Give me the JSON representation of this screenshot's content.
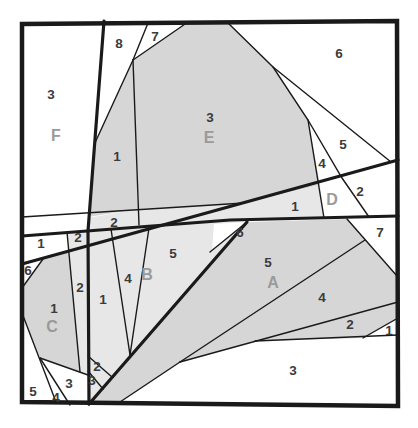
{
  "figure": {
    "canvas": {
      "width": 418,
      "height": 428
    },
    "colors": {
      "background": "#ffffff",
      "line": "#1a1a1a",
      "shade_medium": "#d6d6d6",
      "shade_light": "#e7e7e7",
      "number_label": "#3b3b3b",
      "letter_label": "#9a9a9a"
    },
    "border": {
      "points": [
        [
          22,
          24
        ],
        [
          397,
          21
        ],
        [
          398,
          406
        ],
        [
          22,
          402
        ]
      ],
      "stroke_width": 4.5
    },
    "polygons": [
      {
        "name": "region-E-fill",
        "fill": "medium",
        "points": [
          [
            133,
            60
          ],
          [
            188,
            22
          ],
          [
            227,
            22
          ],
          [
            273,
            67
          ],
          [
            308,
            120
          ],
          [
            320,
            185
          ],
          [
            244,
            203
          ],
          [
            139,
            209
          ]
        ]
      },
      {
        "name": "strip-1-upper-fill",
        "fill": "medium",
        "points": [
          [
            133,
            60
          ],
          [
            94,
            145
          ],
          [
            88,
            217
          ],
          [
            138,
            209
          ]
        ]
      },
      {
        "name": "strip-2-under-E-fill",
        "fill": "light",
        "points": [
          [
            88,
            218
          ],
          [
            138,
            209
          ],
          [
            139,
            225
          ],
          [
            88,
            230
          ]
        ]
      },
      {
        "name": "band-1-D-fill",
        "fill": "light",
        "points": [
          [
            139,
            209
          ],
          [
            244,
            203
          ],
          [
            320,
            185
          ],
          [
            324,
            218
          ],
          [
            230,
            220
          ],
          [
            145,
            230
          ],
          [
            139,
            225
          ]
        ]
      },
      {
        "name": "region-B-fill",
        "fill": "light",
        "points": [
          [
            88,
            230
          ],
          [
            230,
            220
          ],
          [
            247,
            222
          ],
          [
            89,
            404
          ]
        ]
      },
      {
        "name": "wedge-6-fill",
        "fill": "white",
        "points": [
          [
            247,
            222
          ],
          [
            212,
            251
          ],
          [
            214,
            224
          ]
        ]
      },
      {
        "name": "region-A-fill",
        "fill": "medium",
        "points": [
          [
            89,
            404
          ],
          [
            247,
            222
          ],
          [
            347,
            219
          ],
          [
            397,
            276
          ],
          [
            398,
            318
          ],
          [
            363,
            338
          ],
          [
            255,
            341
          ],
          [
            180,
            362
          ],
          [
            120,
            402
          ]
        ]
      },
      {
        "name": "region-C-fill",
        "fill": "medium",
        "points": [
          [
            22,
            288
          ],
          [
            43,
            259
          ],
          [
            69,
            251
          ],
          [
            80,
            372
          ],
          [
            40,
            358
          ],
          [
            22,
            313
          ]
        ]
      },
      {
        "name": "strip-2-left-up-fill",
        "fill": "light",
        "points": [
          [
            67,
            232
          ],
          [
            88,
            231
          ],
          [
            88,
            246
          ],
          [
            69,
            251
          ]
        ]
      },
      {
        "name": "strip-2-left-lo-fill",
        "fill": "light",
        "points": [
          [
            69,
            251
          ],
          [
            88,
            246
          ],
          [
            88,
            375
          ],
          [
            80,
            372
          ]
        ]
      }
    ],
    "thick_lines": [
      {
        "name": "vertical-main-line",
        "points": [
          [
            104,
            21
          ],
          [
            88,
            231
          ],
          [
            89,
            404
          ]
        ]
      },
      {
        "name": "diagonal-upper-line",
        "points": [
          [
            22,
            264
          ],
          [
            398,
            160
          ]
        ]
      },
      {
        "name": "diagonal-middle-line",
        "points": [
          [
            22,
            236
          ],
          [
            230,
            220
          ],
          [
            398,
            216
          ]
        ]
      },
      {
        "name": "diagonal-B-line",
        "points": [
          [
            89,
            404
          ],
          [
            247,
            222
          ]
        ]
      }
    ],
    "thin_lines": [
      {
        "name": "E-bottom-line",
        "points": [
          [
            22,
            217
          ],
          [
            244,
            203
          ]
        ]
      },
      {
        "name": "seven-left-edge",
        "points": [
          [
            148,
            23
          ],
          [
            133,
            60
          ]
        ]
      },
      {
        "name": "seven-right-edge",
        "points": [
          [
            188,
            22
          ],
          [
            133,
            60
          ]
        ]
      },
      {
        "name": "eight-bottom-line",
        "points": [
          [
            133,
            60
          ],
          [
            94,
            145
          ]
        ]
      },
      {
        "name": "E-left-edge",
        "points": [
          [
            133,
            60
          ],
          [
            139,
            225
          ]
        ]
      },
      {
        "name": "E-right-edge",
        "points": [
          [
            227,
            22
          ],
          [
            273,
            67
          ],
          [
            308,
            120
          ],
          [
            324,
            218
          ]
        ]
      },
      {
        "name": "six-five-line",
        "points": [
          [
            273,
            67
          ],
          [
            391,
            162
          ]
        ]
      },
      {
        "name": "four-five-D-line",
        "points": [
          [
            308,
            120
          ],
          [
            342,
            178
          ],
          [
            369,
            217
          ]
        ]
      },
      {
        "name": "six-hypotenuse",
        "points": [
          [
            22,
            288
          ],
          [
            43,
            259
          ]
        ]
      },
      {
        "name": "left-strip-line",
        "points": [
          [
            67,
            232
          ],
          [
            80,
            372
          ]
        ]
      },
      {
        "name": "C-left-edge",
        "points": [
          [
            22,
            313
          ],
          [
            56,
            402
          ]
        ]
      },
      {
        "name": "C-bottom-edge",
        "points": [
          [
            40,
            358
          ],
          [
            88,
            375
          ]
        ]
      },
      {
        "name": "four-three-line",
        "points": [
          [
            40,
            358
          ],
          [
            70,
            405
          ]
        ]
      },
      {
        "name": "B-strip-line-a",
        "points": [
          [
            111,
            229
          ],
          [
            130,
            355
          ]
        ]
      },
      {
        "name": "B-strip-line-b",
        "points": [
          [
            149,
            228
          ],
          [
            130,
            355
          ]
        ]
      },
      {
        "name": "six-wedge-line",
        "points": [
          [
            210,
            252
          ],
          [
            247,
            222
          ]
        ]
      },
      {
        "name": "mini-two-line",
        "points": [
          [
            88,
            356
          ],
          [
            112,
            377
          ]
        ]
      },
      {
        "name": "mini-three-line",
        "points": [
          [
            88,
            371
          ],
          [
            103,
            389
          ]
        ]
      },
      {
        "name": "five-four-A-line",
        "points": [
          [
            180,
            362
          ],
          [
            365,
            240
          ]
        ]
      },
      {
        "name": "four-two-A-line",
        "points": [
          [
            180,
            362
          ],
          [
            398,
            302
          ]
        ]
      },
      {
        "name": "A-bottom-line",
        "points": [
          [
            120,
            402
          ],
          [
            180,
            362
          ]
        ]
      },
      {
        "name": "three-top-line",
        "points": [
          [
            255,
            341
          ],
          [
            398,
            335
          ]
        ]
      },
      {
        "name": "two-one-line",
        "points": [
          [
            363,
            338
          ],
          [
            398,
            318
          ]
        ]
      },
      {
        "name": "seven-wedge-edge",
        "points": [
          [
            347,
            219
          ],
          [
            397,
            276
          ]
        ]
      }
    ],
    "labels": [
      {
        "text": "8",
        "x": 119,
        "y": 43,
        "kind": "number"
      },
      {
        "text": "7",
        "x": 155,
        "y": 36,
        "kind": "number"
      },
      {
        "text": "6",
        "x": 339,
        "y": 53,
        "kind": "number"
      },
      {
        "text": "3",
        "x": 51,
        "y": 94,
        "kind": "number"
      },
      {
        "text": "F",
        "x": 56,
        "y": 135,
        "kind": "letter"
      },
      {
        "text": "3",
        "x": 210,
        "y": 117,
        "kind": "number"
      },
      {
        "text": "E",
        "x": 209,
        "y": 137,
        "kind": "letter"
      },
      {
        "text": "1",
        "x": 117,
        "y": 156,
        "kind": "number"
      },
      {
        "text": "5",
        "x": 343,
        "y": 144,
        "kind": "number"
      },
      {
        "text": "4",
        "x": 322,
        "y": 163,
        "kind": "number"
      },
      {
        "text": "2",
        "x": 360,
        "y": 191,
        "kind": "number"
      },
      {
        "text": "D",
        "x": 332,
        "y": 199,
        "kind": "letter"
      },
      {
        "text": "1",
        "x": 295,
        "y": 206,
        "kind": "number"
      },
      {
        "text": "2",
        "x": 114,
        "y": 222,
        "kind": "number"
      },
      {
        "text": "2",
        "x": 78,
        "y": 237,
        "kind": "number"
      },
      {
        "text": "1",
        "x": 41,
        "y": 243,
        "kind": "number"
      },
      {
        "text": "6",
        "x": 28,
        "y": 270,
        "kind": "number"
      },
      {
        "text": "6",
        "x": 240,
        "y": 232,
        "kind": "number"
      },
      {
        "text": "7",
        "x": 380,
        "y": 232,
        "kind": "number"
      },
      {
        "text": "5",
        "x": 173,
        "y": 253,
        "kind": "number"
      },
      {
        "text": "B",
        "x": 147,
        "y": 274,
        "kind": "letter"
      },
      {
        "text": "4",
        "x": 128,
        "y": 278,
        "kind": "number"
      },
      {
        "text": "5",
        "x": 268,
        "y": 262,
        "kind": "number"
      },
      {
        "text": "A",
        "x": 273,
        "y": 282,
        "kind": "letter"
      },
      {
        "text": "2",
        "x": 80,
        "y": 287,
        "kind": "number"
      },
      {
        "text": "1",
        "x": 103,
        "y": 299,
        "kind": "number"
      },
      {
        "text": "1",
        "x": 54,
        "y": 308,
        "kind": "number"
      },
      {
        "text": "C",
        "x": 52,
        "y": 326,
        "kind": "letter"
      },
      {
        "text": "4",
        "x": 322,
        "y": 297,
        "kind": "number"
      },
      {
        "text": "2",
        "x": 350,
        "y": 324,
        "kind": "number"
      },
      {
        "text": "1",
        "x": 389,
        "y": 330,
        "kind": "number"
      },
      {
        "text": "2",
        "x": 97,
        "y": 366,
        "kind": "number"
      },
      {
        "text": "3",
        "x": 293,
        "y": 370,
        "kind": "number"
      },
      {
        "text": "3",
        "x": 69,
        "y": 383,
        "kind": "number"
      },
      {
        "text": "3",
        "x": 92,
        "y": 380,
        "kind": "number"
      },
      {
        "text": "5",
        "x": 33,
        "y": 391,
        "kind": "number"
      },
      {
        "text": "4",
        "x": 56,
        "y": 397,
        "kind": "number"
      }
    ],
    "label_font": {
      "number_size": 13.5,
      "letter_size": 16
    }
  }
}
